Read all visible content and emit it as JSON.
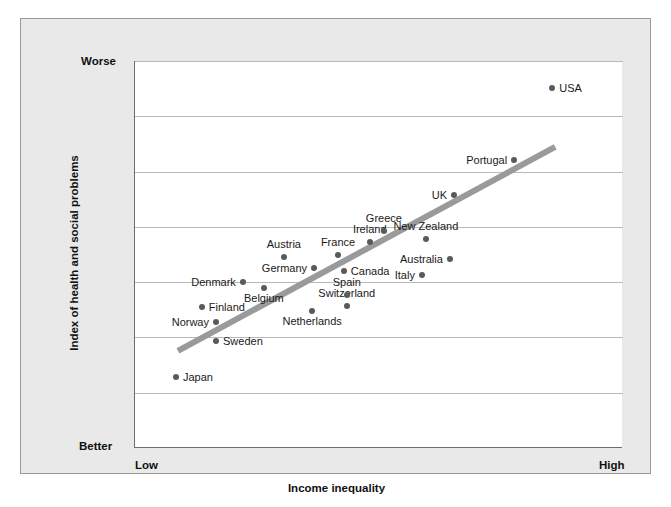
{
  "chart_data": {
    "type": "scatter",
    "title": "",
    "xlabel": "Income inequality",
    "ylabel": "Index of health and social problems",
    "x_tick_labels": [
      "Low",
      "High"
    ],
    "y_tick_labels": [
      "Worse",
      "Better"
    ],
    "y_axis_direction": "Better at bottom, Worse at top",
    "grid": "horizontal gridlines only",
    "gridline_count": 7,
    "legend": "none",
    "xlim": [
      0,
      100
    ],
    "ylim": [
      0,
      100
    ],
    "trendline": {
      "present": true,
      "color": "#9a9a9a",
      "x_start": 8.8,
      "y_start": 25.1,
      "x_end": 86.1,
      "y_end": 77.8
    },
    "points": [
      {
        "label": "Japan",
        "x": 8.4,
        "y": 18.3,
        "label_pos": "right"
      },
      {
        "label": "Sweden",
        "x": 16.6,
        "y": 27.6,
        "label_pos": "right"
      },
      {
        "label": "Norway",
        "x": 16.6,
        "y": 32.5,
        "label_pos": "left"
      },
      {
        "label": "Finland",
        "x": 13.7,
        "y": 36.4,
        "label_pos": "right"
      },
      {
        "label": "Denmark",
        "x": 22.1,
        "y": 42.9,
        "label_pos": "left"
      },
      {
        "label": "Belgium",
        "x": 26.4,
        "y": 41.3,
        "label_pos": "below"
      },
      {
        "label": "Netherlands",
        "x": 36.3,
        "y": 35.4,
        "label_pos": "below"
      },
      {
        "label": "Germany",
        "x": 36.7,
        "y": 46.5,
        "label_pos": "left"
      },
      {
        "label": "Austria",
        "x": 30.5,
        "y": 49.4,
        "label_pos": "above"
      },
      {
        "label": "Switzerland",
        "x": 43.4,
        "y": 36.7,
        "label_pos": "above"
      },
      {
        "label": "Spain",
        "x": 43.4,
        "y": 39.5,
        "label_pos": "above"
      },
      {
        "label": "France",
        "x": 41.6,
        "y": 49.9,
        "label_pos": "above"
      },
      {
        "label": "Canada",
        "x": 42.8,
        "y": 45.7,
        "label_pos": "right"
      },
      {
        "label": "Ireland",
        "x": 48.1,
        "y": 53.2,
        "label_pos": "above"
      },
      {
        "label": "Greece",
        "x": 51.0,
        "y": 56.1,
        "label_pos": "above"
      },
      {
        "label": "Italy",
        "x": 58.8,
        "y": 44.7,
        "label_pos": "left"
      },
      {
        "label": "Australia",
        "x": 64.5,
        "y": 48.8,
        "label_pos": "left"
      },
      {
        "label": "New Zealand",
        "x": 59.6,
        "y": 53.9,
        "label_pos": "above"
      },
      {
        "label": "UK",
        "x": 65.4,
        "y": 65.4,
        "label_pos": "left"
      },
      {
        "label": "Portugal",
        "x": 77.7,
        "y": 74.4,
        "label_pos": "left"
      },
      {
        "label": "USA",
        "x": 85.5,
        "y": 93.0,
        "label_pos": "right"
      }
    ]
  },
  "axes": {
    "y_top_label": "Worse",
    "y_bottom_label": "Better",
    "x_left_label": "Low",
    "x_right_label": "High",
    "x_title": "Income inequality",
    "y_title": "Index of health and social problems"
  },
  "colors": {
    "point": "#5a5a5a",
    "trendline": "#9a9a9a",
    "gridline": "#b9b9b9",
    "axis": "#6e6e6e",
    "panel_background": "#e9e9e9",
    "plot_background": "#ffffff",
    "text": "#111111"
  }
}
